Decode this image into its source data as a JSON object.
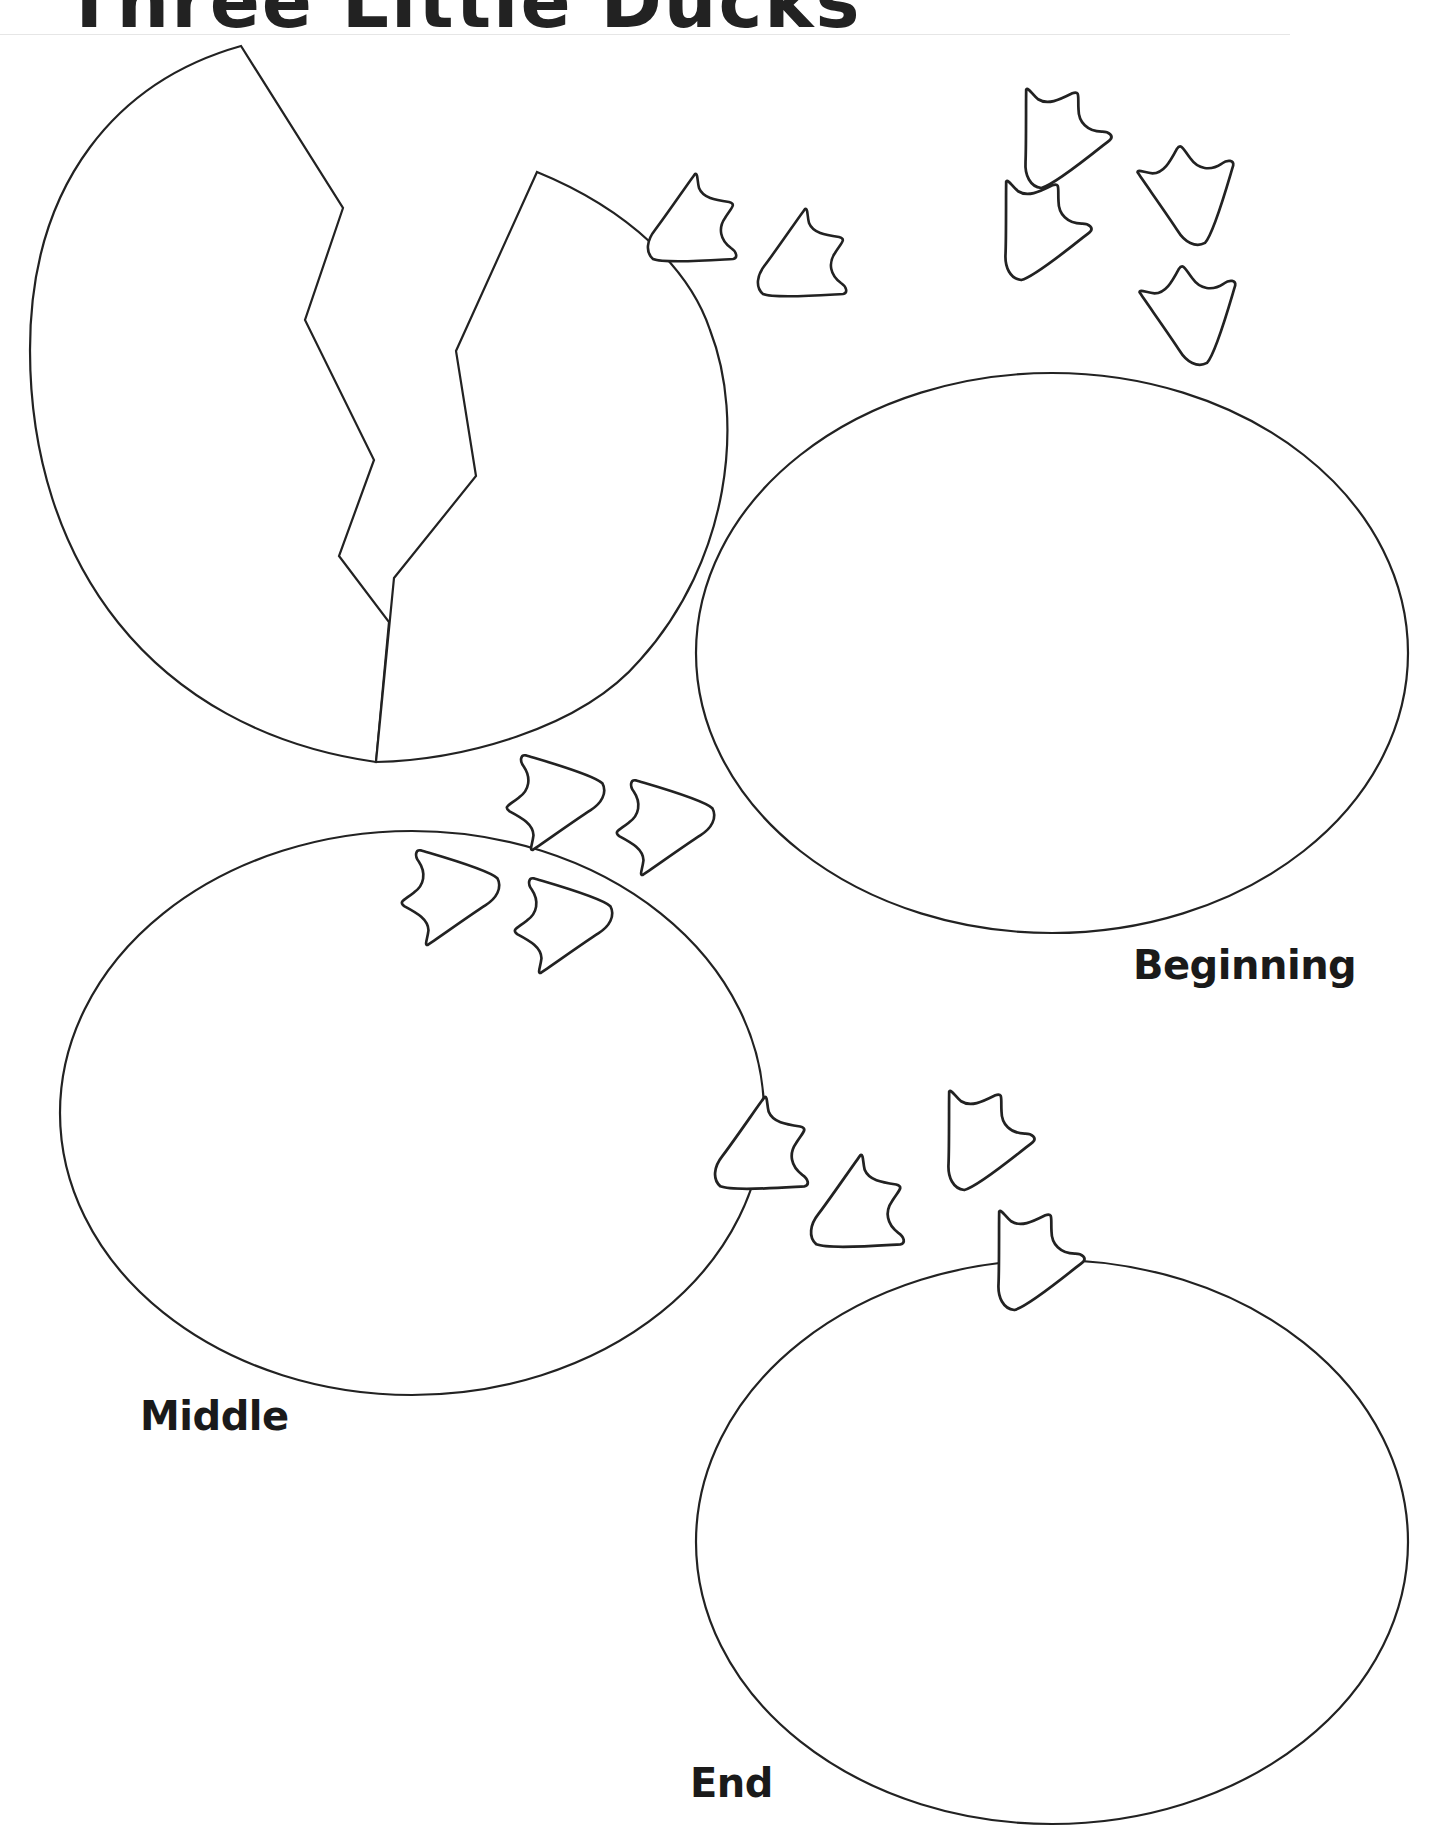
{
  "worksheet": {
    "title": "Three Little Ducks",
    "labels": {
      "beginning": "Beginning",
      "middle": "Middle",
      "end": "End"
    }
  },
  "graphics": {
    "cracked_egg": "cracked-egg-icon",
    "footprint": "duck-footprint-icon",
    "footprint_count": 17,
    "story_eggs": 3,
    "stroke_color": "#222222",
    "background": "#ffffff"
  }
}
